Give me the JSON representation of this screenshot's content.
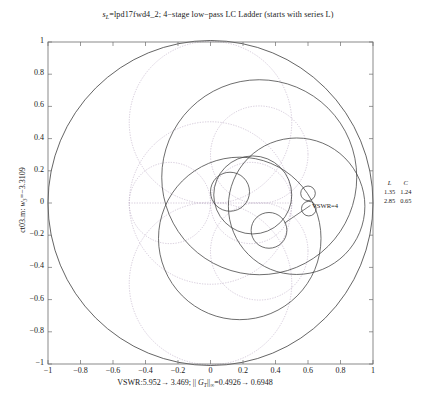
{
  "figure": {
    "title_prefix": "s",
    "title_sub": "L",
    "title_rest": "=lpd17fwd4_2; 4−stage low−pass LC Ladder (starts with series L)",
    "title_full": "s_L=lpd17fwd4_2; 4−stage low−pass LC Ladder (starts with series L)",
    "ylabel_full": "ct03.m: w_3=−3.3109",
    "ylabel_prefix": "ct03.m: ",
    "ylabel_var": "w",
    "ylabel_varsub": "3",
    "ylabel_value": "=−3.3109",
    "xlabel_full": "VSWR:5.952→ 3.469; || G_T||_∞=0.4926→ 0.6948",
    "xlabel_p1": "VSWR:5.952",
    "xlabel_arrow1": "→",
    "xlabel_p2": " 3.469; || ",
    "xlabel_g": "G",
    "xlabel_gsub": "T",
    "xlabel_bars": "||",
    "xlabel_inf": "∞",
    "xlabel_p3": "=0.4926",
    "xlabel_arrow2": "→",
    "xlabel_p4": " 0.6948",
    "annotation": "VSWR=4",
    "axis_color": "#6d6d6d",
    "curve_color": "#3d3d3d",
    "grid_color": "#c0b0c8"
  },
  "chart_data": {
    "type": "scatter",
    "xlabel": "VSWR:5.952→ 3.469; || G_T||_∞=0.4926→ 0.6948",
    "ylabel": "ct03.m: w_3=−3.3109",
    "xlim": [
      -1,
      1
    ],
    "ylim": [
      -1,
      1
    ],
    "grid": false,
    "legend_position": "right-outside",
    "xticks": [
      "−1",
      "−0.8",
      "−0.6",
      "−0.4",
      "−0.2",
      "0",
      "0.2",
      "0.4",
      "0.6",
      "0.8",
      "1"
    ],
    "xtick_values": [
      -1,
      -0.8,
      -0.6,
      -0.4,
      -0.2,
      0,
      0.2,
      0.4,
      0.6,
      0.8,
      1
    ],
    "yticks": [
      "1",
      "0.8",
      "0.6",
      "0.4",
      "0.2",
      "0",
      "−0.2",
      "−0.4",
      "−0.6",
      "−0.8",
      "−1"
    ],
    "ytick_values": [
      1,
      0.8,
      0.6,
      0.4,
      0.2,
      0,
      -0.2,
      -0.4,
      -0.6,
      -0.8,
      -1
    ],
    "annotations": [
      {
        "text": "VSWR=4",
        "x": 0.62,
        "y": 0.02
      }
    ],
    "unit_circle": {
      "cx": 0,
      "cy": 0,
      "r": 1.0
    },
    "vswr_circle": {
      "cx": 0.0,
      "cy": 0.0,
      "r": 0.6,
      "label": "VSWR=4"
    },
    "trajectory_circles": [
      {
        "cx": 0.3,
        "cy": 0.16,
        "r": 0.6
      },
      {
        "cx": 0.18,
        "cy": -0.22,
        "r": 0.5
      },
      {
        "cx": 0.53,
        "cy": -0.02,
        "r": 0.42
      },
      {
        "cx": 0.26,
        "cy": 0.05,
        "r": 0.24
      },
      {
        "cx": 0.12,
        "cy": 0.07,
        "r": 0.12
      },
      {
        "cx": 0.36,
        "cy": -0.17,
        "r": 0.11
      },
      {
        "cx": 0.6,
        "cy": 0.06,
        "r": 0.045
      },
      {
        "cx": 0.605,
        "cy": -0.035,
        "r": 0.045
      }
    ],
    "smith_grid_circles": [
      {
        "cx": 0.0,
        "cy": 0.0,
        "r": 0.5
      },
      {
        "cx": 0.25,
        "cy": 0.0,
        "r": 0.25
      },
      {
        "cx": -0.25,
        "cy": 0.0,
        "r": 0.25
      },
      {
        "cx": 0.0,
        "cy": 0.5,
        "r": 0.5
      },
      {
        "cx": 0.0,
        "cy": -0.5,
        "r": 0.5
      },
      {
        "cx": 0.3,
        "cy": 0.3,
        "r": 0.3
      },
      {
        "cx": 0.3,
        "cy": -0.3,
        "r": 0.3
      }
    ],
    "legend_table": {
      "headers": [
        "L",
        "C"
      ],
      "rows": [
        [
          "1.35",
          "1.24"
        ],
        [
          "2.85",
          "0.65"
        ]
      ]
    }
  }
}
